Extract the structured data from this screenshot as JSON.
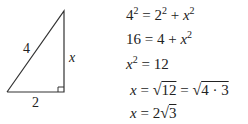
{
  "figure": {
    "type": "right-triangle",
    "labels": {
      "hypotenuse": "4",
      "vertical_leg": "x",
      "base": "2"
    }
  },
  "equations": [
    {
      "lhs_base": "4",
      "lhs_exp": "2",
      "eq": "=",
      "t1_base": "2",
      "t1_exp": "2",
      "plus": "+",
      "t2_base": "x",
      "t2_exp": "2"
    },
    {
      "lhs": "16",
      "eq": "=",
      "t1": "4",
      "plus": "+",
      "t2_base": "x",
      "t2_exp": "2"
    },
    {
      "lhs_base": "x",
      "lhs_exp": "2",
      "eq": "=",
      "rhs": "12"
    },
    {
      "lhs": "x",
      "eq": "=",
      "radical": "√",
      "radicand1": "12",
      "eq2": "=",
      "radical2": "√",
      "radicand2": "4 · 3"
    },
    {
      "lhs": "x",
      "eq": "=",
      "coef": "2",
      "radical": "√",
      "radicand": "3"
    }
  ]
}
